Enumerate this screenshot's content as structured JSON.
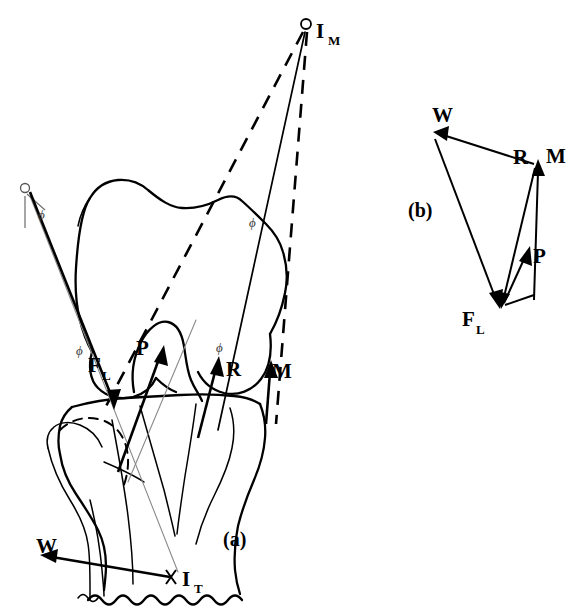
{
  "figure": {
    "background_color": "#ffffff",
    "line_color": "#000000",
    "faint_line_color": "#8a8a8a",
    "panels": [
      {
        "id": "a",
        "label": "(a)",
        "description": "Lateral view of knee joint with force lines of action"
      },
      {
        "id": "b",
        "label": "(b)",
        "description": "Closed force polygon (force triangle)"
      }
    ]
  },
  "panel_a": {
    "caption": "(a)",
    "instant_centers": [
      {
        "name": "I_M",
        "label_main": "I",
        "label_sub": "M",
        "x": 306,
        "y": 24
      },
      {
        "name": "I_T",
        "label_main": "I",
        "label_sub": "T",
        "x": 172,
        "y": 578
      }
    ],
    "vectors": [
      {
        "name": "F_L",
        "label_main": "F",
        "label_sub": "L",
        "label_x": 92,
        "label_y": 366,
        "direction": "down-left",
        "description": "Lateral collateral / femorotibial contact force"
      },
      {
        "name": "P",
        "label_main": "P",
        "label_sub": "",
        "label_x": 140,
        "label_y": 350,
        "direction": "up-right",
        "description": "Patellar tendon force"
      },
      {
        "name": "R",
        "label_main": "R",
        "label_sub": "",
        "label_x": 229,
        "label_y": 369,
        "direction": "up",
        "description": "Resultant joint reaction force"
      },
      {
        "name": "M",
        "label_main": "M",
        "label_sub": "",
        "label_x": 274,
        "label_y": 372,
        "direction": "up",
        "description": "Muscle force"
      },
      {
        "name": "W",
        "label_main": "W",
        "label_sub": "",
        "label_x": 39,
        "label_y": 548,
        "direction": "left",
        "description": "Body weight line of action"
      }
    ],
    "angle_markers": [
      {
        "symbol": "ϕ",
        "x": 42,
        "y": 215
      },
      {
        "symbol": "ϕ",
        "x": 80,
        "y": 351
      },
      {
        "symbol": "ϕ",
        "x": 220,
        "y": 348
      },
      {
        "symbol": "ϕ",
        "x": 253,
        "y": 223
      }
    ],
    "pivot_marker": {
      "name": "reference-pivot",
      "x": 25,
      "y": 188
    }
  },
  "panel_b": {
    "caption": "(b)",
    "caption_x": 420,
    "caption_y": 216,
    "type": "force-polygon",
    "vertices": [
      {
        "name": "W",
        "x": 434,
        "y": 133
      },
      {
        "name": "R",
        "x": 537,
        "y": 162
      },
      {
        "name": "M",
        "x": 540,
        "y": 160
      },
      {
        "name": "F_L",
        "x": 500,
        "y": 308
      },
      {
        "name": "P",
        "x": 528,
        "y": 251
      }
    ],
    "labels": [
      {
        "name": "W",
        "label_main": "W",
        "label_sub": "",
        "x": 437,
        "y": 121
      },
      {
        "name": "R",
        "label_main": "R",
        "label_sub": "",
        "x": 522,
        "y": 158
      },
      {
        "name": "M",
        "label_main": "M",
        "label_sub": "",
        "x": 551,
        "y": 157
      },
      {
        "name": "P",
        "label_main": "P",
        "label_sub": "",
        "x": 537,
        "y": 259
      },
      {
        "name": "F_L",
        "label_main": "F",
        "label_sub": "L",
        "x": 466,
        "y": 325
      }
    ]
  }
}
